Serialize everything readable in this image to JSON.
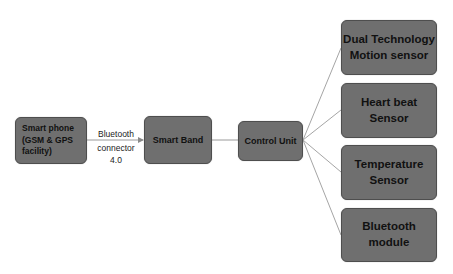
{
  "diagram": {
    "type": "block-diagram",
    "colors": {
      "node_fill": "#6f6f6f",
      "node_border": "#4e4e4e",
      "edge": "#9a9a9a",
      "text": "#111111",
      "background": "#ffffff"
    },
    "nodes": {
      "phone": {
        "lines": [
          "Smart phone",
          "(GSM & GPS",
          "facility)"
        ]
      },
      "band": {
        "lines": [
          "Smart Band"
        ]
      },
      "control": {
        "lines": [
          "Control Unit"
        ]
      },
      "dual": {
        "lines": [
          "Dual Technology",
          "Motion sensor"
        ]
      },
      "heart": {
        "lines": [
          "Heart beat",
          "Sensor"
        ]
      },
      "temp": {
        "lines": [
          "Temperature",
          "Sensor"
        ]
      },
      "bt": {
        "lines": [
          "Bluetooth",
          "module"
        ]
      }
    },
    "edges": [
      {
        "from": "phone",
        "to": "band",
        "label": [
          "Bluetooth",
          "connector",
          "4.0"
        ],
        "arrow": true
      },
      {
        "from": "band",
        "to": "control",
        "arrow": false
      },
      {
        "from": "control",
        "to": "dual",
        "arrow": false
      },
      {
        "from": "control",
        "to": "heart",
        "arrow": false
      },
      {
        "from": "control",
        "to": "temp",
        "arrow": false
      },
      {
        "from": "control",
        "to": "bt",
        "arrow": false
      }
    ]
  }
}
